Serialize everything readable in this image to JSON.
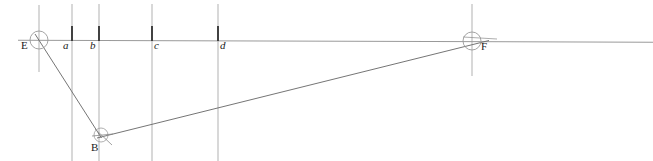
{
  "diagram": {
    "canvas": {
      "width": 653,
      "height": 161,
      "background": "#ffffff"
    },
    "colors": {
      "horizon": "#9a9a9a",
      "vertical_light": "#a8a8a8",
      "tick_dark": "#3a3a3a",
      "ray": "#6e6e6e",
      "circle": "#8a8a8a",
      "label": "#1a1a1a"
    },
    "points": [
      {
        "id": "E",
        "label": "E",
        "x": 39,
        "y": 40,
        "label_x": 21,
        "label_y": 41,
        "marker": "circle",
        "radius": 9
      },
      {
        "id": "F",
        "label": "F",
        "x": 472,
        "y": 41,
        "label_x": 481,
        "label_y": 42,
        "marker": "circle",
        "radius": 9
      },
      {
        "id": "B",
        "label": "B",
        "x": 100,
        "y": 136,
        "label_x": 91,
        "label_y": 143,
        "marker": "tick",
        "radius": 7
      }
    ],
    "measure_lines": [
      {
        "id": "a",
        "label": "a",
        "x": 72,
        "label_x": 63,
        "label_y": 41
      },
      {
        "id": "b",
        "label": "b",
        "x": 99,
        "label_x": 90,
        "label_y": 41
      },
      {
        "id": "c",
        "label": "c",
        "x": 152,
        "label_x": 154,
        "label_y": 41
      },
      {
        "id": "d",
        "label": "d",
        "x": 218,
        "label_x": 220,
        "label_y": 41
      }
    ],
    "horizon_line": {
      "x1": 18,
      "y1": 40,
      "x2": 653,
      "y2": 42
    },
    "rays": [
      {
        "id": "ray-E-B",
        "from": "E",
        "to": "B",
        "x1": 36,
        "y1": 36,
        "x2": 101,
        "y2": 137
      },
      {
        "id": "ray-B-F",
        "from": "B",
        "to": "F",
        "x1": 99,
        "y1": 137,
        "x2": 474,
        "y2": 43
      }
    ],
    "vertical_rules": [
      {
        "id": "v-E",
        "x": 39,
        "y1": 5,
        "y2": 72,
        "weight": "light"
      },
      {
        "id": "v-a",
        "x": 72,
        "y1": 5,
        "y2": 161,
        "weight": "light"
      },
      {
        "id": "v-b",
        "x": 99,
        "y1": 5,
        "y2": 161,
        "weight": "light"
      },
      {
        "id": "v-c",
        "x": 152,
        "y1": 5,
        "y2": 161,
        "weight": "light"
      },
      {
        "id": "v-d",
        "x": 218,
        "y1": 5,
        "y2": 161,
        "weight": "light"
      },
      {
        "id": "v-F",
        "x": 472,
        "y1": 5,
        "y2": 76,
        "weight": "light"
      }
    ],
    "tick_marks": [
      {
        "id": "tick-a",
        "x": 72,
        "y1": 26,
        "y2": 41
      },
      {
        "id": "tick-b",
        "x": 99,
        "y1": 26,
        "y2": 41
      },
      {
        "id": "tick-c",
        "x": 152,
        "y1": 26,
        "y2": 41
      },
      {
        "id": "tick-d",
        "x": 218,
        "y1": 26,
        "y2": 41
      }
    ]
  }
}
